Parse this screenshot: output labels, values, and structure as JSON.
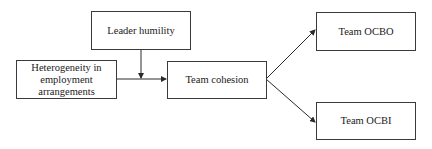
{
  "diagram": {
    "nodes": [
      {
        "id": "leader_humility",
        "label": "Leader humility"
      },
      {
        "id": "heterogeneity",
        "label": "Heterogeneity in employment arrangements"
      },
      {
        "id": "team_cohesion",
        "label": "Team cohesion"
      },
      {
        "id": "team_ocbo",
        "label": "Team OCBO"
      },
      {
        "id": "team_ocbi",
        "label": "Team OCBI"
      }
    ],
    "edges": [
      {
        "from": "heterogeneity",
        "to": "team_cohesion"
      },
      {
        "from": "leader_humility",
        "to": "heterogeneity->team_cohesion",
        "type": "moderation"
      },
      {
        "from": "team_cohesion",
        "to": "team_ocbo"
      },
      {
        "from": "team_cohesion",
        "to": "team_ocbi"
      }
    ]
  }
}
